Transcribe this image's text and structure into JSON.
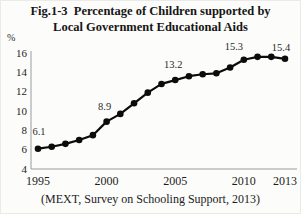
{
  "figure": {
    "title_line1": "Fig.1-3  Percentage of Children supported by",
    "title_line2": "Local Government Educational Aids",
    "unit": "%",
    "source": "(MEXT, Survey on Schooling Support, 2013)"
  },
  "chart_data": {
    "type": "line",
    "title": "Fig.1-3 Percentage of Children supported by Local Government Educational Aids",
    "series_name": "Percentage of children supported by local government educational aids",
    "x": [
      1995,
      1996,
      1997,
      1998,
      1999,
      2000,
      2001,
      2002,
      2003,
      2004,
      2005,
      2006,
      2007,
      2008,
      2009,
      2010,
      2011,
      2012,
      2013
    ],
    "values": [
      6.1,
      6.3,
      6.6,
      7.0,
      7.5,
      8.9,
      9.7,
      10.8,
      11.9,
      12.8,
      13.2,
      13.6,
      13.8,
      13.9,
      14.5,
      15.3,
      15.6,
      15.6,
      15.4
    ],
    "xlabel": "",
    "ylabel": "%",
    "ylim": [
      4,
      16
    ],
    "yticks": [
      4,
      6,
      8,
      10,
      12,
      14,
      16
    ],
    "xticks": [
      1995,
      2000,
      2005,
      2010,
      2013
    ],
    "grid": false,
    "legend": false,
    "marker": "circle",
    "line_color": "#0c0c0c",
    "axis_color": "#9a9a9a",
    "annotations": [
      {
        "x": 1995,
        "y": 6.1,
        "text": "6.1"
      },
      {
        "x": 2000,
        "y": 8.9,
        "text": "8.9"
      },
      {
        "x": 2005,
        "y": 13.2,
        "text": "13.2"
      },
      {
        "x": 2010,
        "y": 15.3,
        "text": "15.3"
      },
      {
        "x": 2013,
        "y": 15.4,
        "text": "15.4"
      }
    ],
    "source": "(MEXT, Survey on Schooling Support, 2013)"
  }
}
